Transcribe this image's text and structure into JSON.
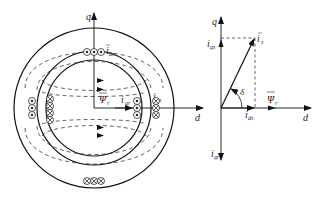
{
  "diagram": {
    "type": "motor cross-section with d-q axis current vector diagram",
    "left": {
      "axes": {
        "q": "q",
        "d": "d"
      },
      "labels": {
        "flux_symbol": "Ψ",
        "flux_sub": "r",
        "iqr_main": "i",
        "iqr_sub": "qr",
        "ids_main": "i",
        "ids_sub": "ds",
        "iqs_main": "i",
        "iqs_sub": "qs"
      },
      "conductors": {
        "top": {
          "symbol": "dot",
          "count": 3
        },
        "bottom": {
          "symbol": "cross",
          "count": 3
        },
        "left_outer": {
          "symbol": "dot",
          "count": 3
        },
        "left_inner": {
          "symbol": "cross",
          "count": 3
        },
        "right_inner": {
          "symbol": "dot",
          "count": 3
        },
        "right_outer": {
          "symbol": "cross",
          "count": 3
        }
      }
    },
    "right": {
      "axes": {
        "q": "q",
        "d": "d"
      },
      "labels": {
        "is_main": "i",
        "is_sub": "s",
        "iqs_main": "i",
        "iqs_sub": "qs",
        "ids_main": "i",
        "ids_sub": "ds",
        "iqr_main": "i",
        "iqr_sub": "qr",
        "flux_symbol": "Ψ",
        "flux_sub": "r",
        "angle": "δ"
      }
    }
  }
}
